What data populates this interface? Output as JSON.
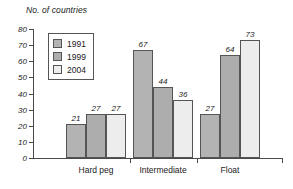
{
  "chart_data": {
    "type": "bar",
    "title": "No. of countries",
    "xlabel": "",
    "ylabel": "No. of countries",
    "ylim": [
      0,
      80
    ],
    "yticks": [
      0,
      10,
      20,
      30,
      40,
      50,
      60,
      70,
      80
    ],
    "grid": false,
    "legend_position": "top-left",
    "categories": [
      "Hard peg",
      "Intermediate",
      "Float"
    ],
    "series": [
      {
        "name": "1991",
        "color": "#b3b3b3",
        "values": [
          21,
          67,
          27
        ]
      },
      {
        "name": "1999",
        "color": "#adadad",
        "values": [
          27,
          44,
          64
        ]
      },
      {
        "name": "2004",
        "color": "#ededed",
        "values": [
          27,
          36,
          73
        ]
      }
    ],
    "data_labels": [
      [
        "21",
        "27",
        "27"
      ],
      [
        "67",
        "44",
        "36"
      ],
      [
        "27",
        "64",
        "73"
      ]
    ]
  },
  "axis": {
    "title": "No. of countries",
    "tick_labels": [
      "80",
      "70",
      "60",
      "50",
      "40",
      "30",
      "20",
      "10",
      "0"
    ],
    "category_labels": [
      "Hard peg",
      "Intermediate",
      "Float"
    ]
  },
  "legend": {
    "items": [
      {
        "label": "1991"
      },
      {
        "label": "1999"
      },
      {
        "label": "2004"
      }
    ]
  }
}
